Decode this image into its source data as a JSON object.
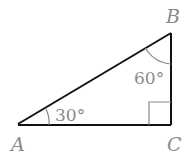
{
  "diagram": {
    "type": "right-triangle",
    "vertices": {
      "A": {
        "label": "A",
        "x": 18,
        "y": 124
      },
      "B": {
        "label": "B",
        "x": 171,
        "y": 33
      },
      "C": {
        "label": "C",
        "x": 171,
        "y": 125
      }
    },
    "angles": {
      "A": {
        "label": "30°"
      },
      "B": {
        "label": "60°"
      },
      "C": {
        "label": "right-angle"
      }
    },
    "colors": {
      "edge": "#111111",
      "annotation": "#8a8a8a"
    }
  }
}
